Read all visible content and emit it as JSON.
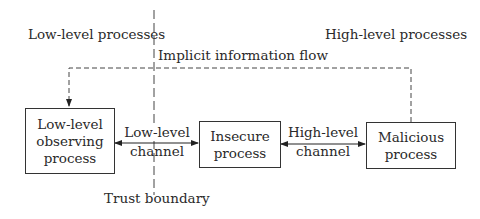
{
  "diagram": {
    "regions": {
      "left_label": "Low-level processes",
      "right_label": "High-level processes"
    },
    "implicit_flow_label": "Implicit information flow",
    "trust_boundary_label": "Trust boundary",
    "nodes": {
      "observer": {
        "line1": "Low-level",
        "line2": "observing",
        "line3": "process"
      },
      "insecure": {
        "line1": "Insecure",
        "line2": "process"
      },
      "malicious": {
        "line1": "Malicious",
        "line2": "process"
      }
    },
    "edges": {
      "low_channel": {
        "line1": "Low-level",
        "line2": "channel"
      },
      "high_channel": {
        "line1": "High-level",
        "line2": "channel"
      }
    },
    "colors": {
      "stroke": "#333333",
      "text": "#2a2a2a",
      "background": "#ffffff"
    }
  }
}
